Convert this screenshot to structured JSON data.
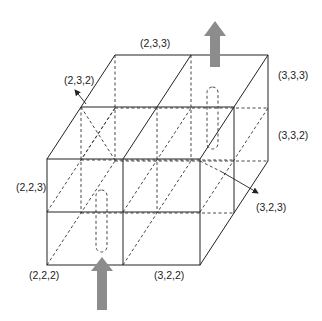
{
  "diagram": {
    "type": "3d-cell-grid",
    "labels": {
      "top_back": "(2,3,3)",
      "top_left_arrow": "(2,3,2)",
      "right_top": "(3,3,3)",
      "right_middle": "(3,3,2)",
      "left_middle": "(2,2,3)",
      "right_arrow": "(3,2,3)",
      "bottom_left": "(2,2,2)",
      "bottom_right": "(3,2,2)"
    },
    "arrows": {
      "inflow": "bottom (upward, gray)",
      "outflow": "top (upward, gray)"
    },
    "colors": {
      "line": "#222222",
      "flow_arrow": "#8c8c8c",
      "background": "#ffffff"
    }
  }
}
